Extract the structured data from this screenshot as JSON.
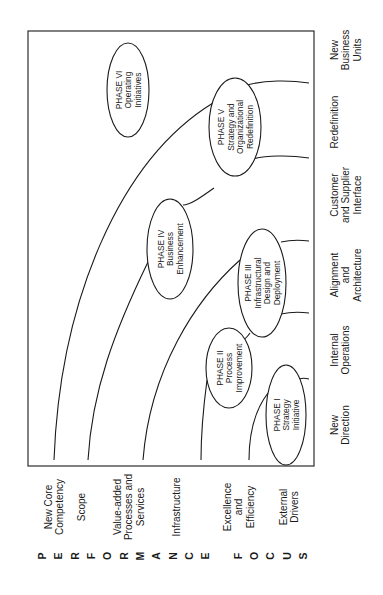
{
  "diagram": {
    "orientation": "rotated-90-ccw",
    "phases": [
      {
        "id": "phase-1",
        "lines": [
          "PHASE I",
          "Strategy",
          "Initiative"
        ],
        "cx": 286,
        "cy": 415,
        "rx": 20,
        "ry": 50
      },
      {
        "id": "phase-2",
        "lines": [
          "PHASE II",
          "Process",
          "Improvement"
        ],
        "cx": 229,
        "cy": 368,
        "rx": 23,
        "ry": 40
      },
      {
        "id": "phase-3",
        "lines": [
          "PHASE  III",
          "Infrastructural",
          "Design and",
          "Deployment"
        ],
        "cx": 262,
        "cy": 283,
        "rx": 24,
        "ry": 54
      },
      {
        "id": "phase-4",
        "lines": [
          "PHASE IV",
          "Business",
          "Enhancement"
        ],
        "cx": 170,
        "cy": 249,
        "rx": 23,
        "ry": 50
      },
      {
        "id": "phase-5",
        "lines": [
          "PHASE  V",
          "Strategy and",
          "Organizational",
          "Redefinition"
        ],
        "cx": 235,
        "cy": 127,
        "rx": 26,
        "ry": 49
      },
      {
        "id": "phase-6",
        "lines": [
          "PHASE  VI",
          "Operating",
          "Initiatives"
        ],
        "cx": 128,
        "cy": 90,
        "rx": 21,
        "ry": 47
      }
    ],
    "focus_axis_labels": [
      {
        "lines": [
          "New",
          "Direction"
        ],
        "x": 334,
        "y": 425
      },
      {
        "lines": [
          "Internal",
          "Operations"
        ],
        "x": 334,
        "y": 350
      },
      {
        "lines": [
          "Alignment",
          "and",
          "Architecture"
        ],
        "x": 334,
        "y": 275
      },
      {
        "lines": [
          "Customer",
          "and Supplier",
          "Interface"
        ],
        "x": 334,
        "y": 195
      },
      {
        "lines": [
          "Redefinition"
        ],
        "x": 334,
        "y": 122
      },
      {
        "lines": [
          "New",
          "Business",
          "Units"
        ],
        "x": 334,
        "y": 50
      }
    ],
    "performance_axis_labels": [
      {
        "lines": [
          "New Core",
          "Competency"
        ],
        "x": 48,
        "y": 507
      },
      {
        "lines": [
          "Scope"
        ],
        "x": 81,
        "y": 507
      },
      {
        "lines": [
          "Value-added",
          "Processes and",
          "Services"
        ],
        "x": 117,
        "y": 507
      },
      {
        "lines": [
          "Infrastructure"
        ],
        "x": 176,
        "y": 507
      },
      {
        "lines": [
          "Excellence",
          "and",
          "Efficiency"
        ],
        "x": 227,
        "y": 507
      },
      {
        "lines": [
          "External",
          "Drivers"
        ],
        "x": 283,
        "y": 507
      }
    ],
    "vertical_title": {
      "letters": [
        "P",
        "E",
        "R",
        "F",
        "O",
        "R",
        "M",
        "A",
        "N",
        "C",
        "E",
        " ",
        "F",
        "O",
        "C",
        "U",
        "S"
      ],
      "text": "PERFORMANCE FOCUS",
      "y": 556,
      "x_start": 42,
      "x_end": 303
    }
  },
  "colors": {
    "line": "#1a1a1a",
    "background": "#ffffff"
  }
}
